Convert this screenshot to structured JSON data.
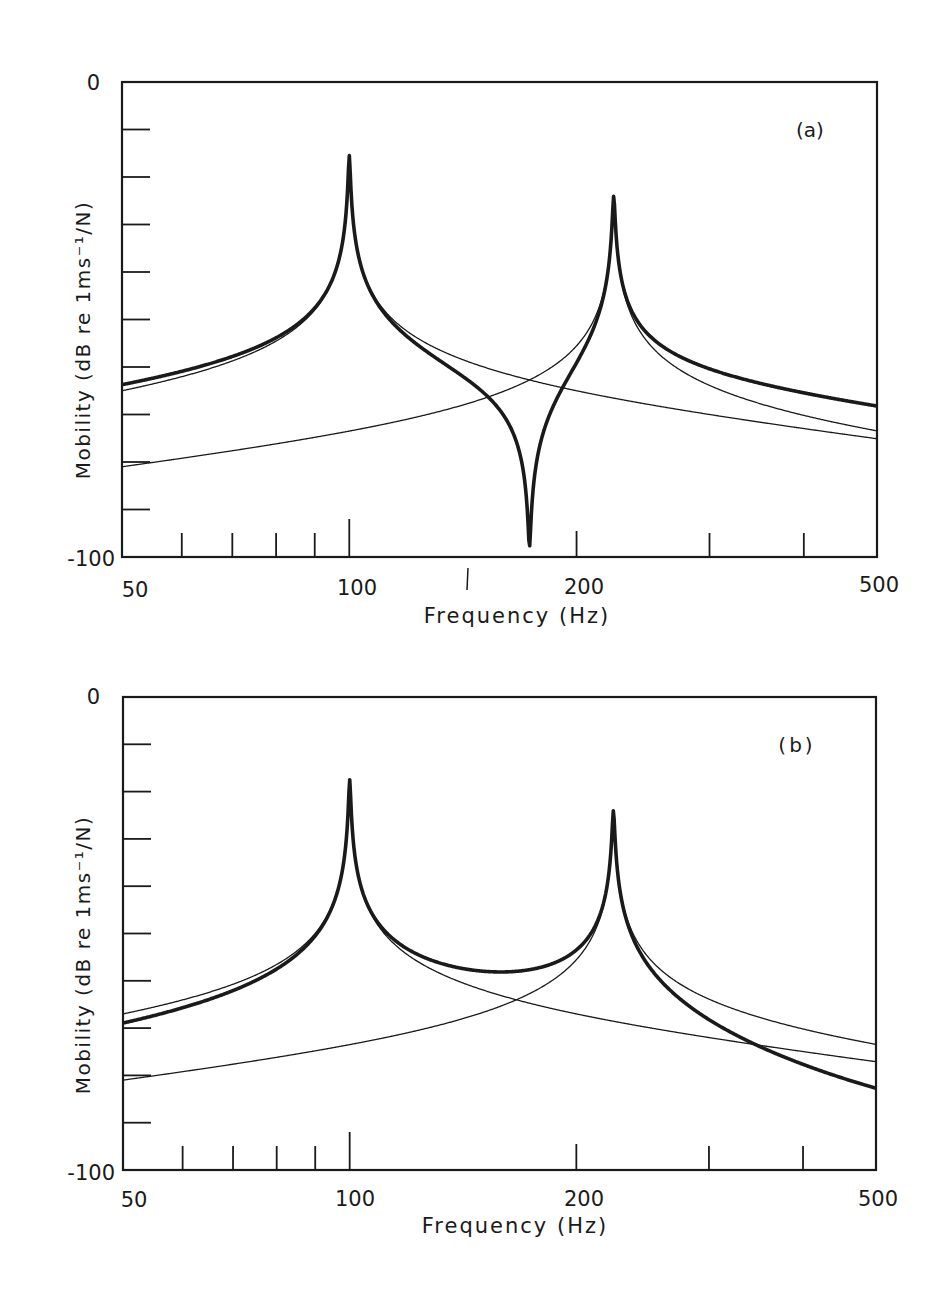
{
  "figure": {
    "panels": [
      {
        "id": "a",
        "panel_label": "(a)",
        "ylabel": "Mobility (dB re 1ms⁻¹/N)",
        "xlabel": "Frequency (Hz)",
        "y_tick_labels": {
          "top": "0",
          "bottom": "-100"
        },
        "x_tick_labels": [
          "50",
          "100",
          "200",
          "500"
        ]
      },
      {
        "id": "b",
        "panel_label": "(b)",
        "ylabel": "Mobility (dB re 1ms⁻¹/N)",
        "xlabel": "Frequency (Hz)",
        "y_tick_labels": {
          "top": "0",
          "bottom": "-100"
        },
        "x_tick_labels": [
          "50",
          "100",
          "200",
          "500"
        ]
      }
    ]
  },
  "chart_data": [
    {
      "type": "line",
      "title": "(a)",
      "xlabel": "Frequency (Hz)",
      "ylabel": "Mobility (dB re 1ms⁻¹/N)",
      "xscale": "log",
      "xlim": [
        50,
        500
      ],
      "ylim": [
        -100,
        0
      ],
      "x_ticks_major": [
        50,
        100,
        200,
        500
      ],
      "x_ticks_minor": [
        60,
        70,
        80,
        90,
        300,
        400
      ],
      "y_ticks": [
        0,
        -10,
        -20,
        -30,
        -40,
        -50,
        -60,
        -70,
        -80,
        -90,
        -100
      ],
      "grid": false,
      "legend": null,
      "model": {
        "f1": 100,
        "f2": 224,
        "level1_at_50": -65,
        "level2_at_50": -81,
        "eta1": 0.005,
        "eta2": 0.006,
        "mode2_sign": 1
      },
      "series": [
        {
          "name": "Mode 1 contribution (thin)",
          "x": [
            50,
            70,
            90,
            100,
            120,
            175,
            224,
            300,
            500
          ],
          "values": [
            -65,
            -59,
            -44,
            -15,
            -51,
            -63,
            -66,
            -68,
            -73
          ]
        },
        {
          "name": "Mode 2 contribution (thin)",
          "x": [
            50,
            70,
            100,
            150,
            175,
            200,
            224,
            300,
            500
          ],
          "values": [
            -81,
            -78,
            -74,
            -65,
            -59,
            -48,
            -21,
            -55,
            -72
          ]
        },
        {
          "name": "Total mobility (thick)",
          "x": [
            50,
            70,
            90,
            100,
            120,
            150,
            175,
            200,
            224,
            300,
            500
          ],
          "values": [
            -64,
            -58,
            -43,
            -15,
            -53,
            -72,
            -100,
            -60,
            -21,
            -54,
            -67
          ]
        }
      ],
      "annotations": [
        "Antiresonance near 175 Hz"
      ]
    },
    {
      "type": "line",
      "title": "(b)",
      "xlabel": "Frequency (Hz)",
      "ylabel": "Mobility (dB re 1ms⁻¹/N)",
      "xscale": "log",
      "xlim": [
        50,
        500
      ],
      "ylim": [
        -100,
        0
      ],
      "x_ticks_major": [
        50,
        100,
        200,
        500
      ],
      "x_ticks_minor": [
        60,
        70,
        80,
        90,
        300,
        400
      ],
      "y_ticks": [
        0,
        -10,
        -20,
        -30,
        -40,
        -50,
        -60,
        -70,
        -80,
        -90,
        -100
      ],
      "grid": false,
      "legend": null,
      "model": {
        "f1": 100,
        "f2": 224,
        "level1_at_50": -67,
        "level2_at_50": -81,
        "eta1": 0.005,
        "eta2": 0.006,
        "mode2_sign": -1
      },
      "series": [
        {
          "name": "Mode 1 contribution (thin)",
          "x": [
            50,
            70,
            90,
            100,
            120,
            175,
            224,
            300,
            500
          ],
          "values": [
            -67,
            -61,
            -46,
            -15,
            -53,
            -65,
            -68,
            -70,
            -75
          ]
        },
        {
          "name": "Mode 2 contribution (thin)",
          "x": [
            50,
            70,
            100,
            150,
            175,
            200,
            224,
            300,
            500
          ],
          "values": [
            -81,
            -78,
            -74,
            -65,
            -59,
            -48,
            -22,
            -55,
            -74
          ]
        },
        {
          "name": "Total mobility (thick)",
          "x": [
            50,
            70,
            90,
            100,
            120,
            150,
            175,
            200,
            224,
            300,
            500
          ],
          "values": [
            -67,
            -60,
            -45,
            -15,
            -51,
            -58,
            -57,
            -50,
            -22,
            -63,
            -89
          ]
        }
      ]
    }
  ]
}
